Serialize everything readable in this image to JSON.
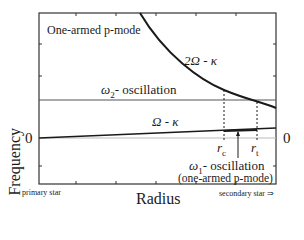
{
  "diagram": {
    "mode_title": "One-armed p-mode",
    "y_axis_label": "Frequency",
    "x_axis_label": "Radius",
    "zero_label": "0",
    "left_caption": "primary star",
    "right_caption": "secondary star ⇒",
    "curves": {
      "upper": {
        "label_prefix": "2",
        "label_symbol": "Ω",
        "label_suffix": " - κ"
      },
      "lower": {
        "label_symbol": "Ω",
        "label_suffix": " - κ"
      }
    },
    "omega2": {
      "symbol": "ω",
      "sub": "2",
      "text": "- oscillation"
    },
    "omega1": {
      "symbol": "ω",
      "sub": "1",
      "text": "- oscillation",
      "note": "(one-armed p-mode)"
    },
    "radii": {
      "rc": {
        "symbol": "r",
        "sub": "c"
      },
      "rt": {
        "symbol": "r",
        "sub": "t"
      }
    },
    "colors": {
      "line": "#1a1a1a",
      "frame": "#333333",
      "zero_line": "#bbbbbb"
    }
  }
}
